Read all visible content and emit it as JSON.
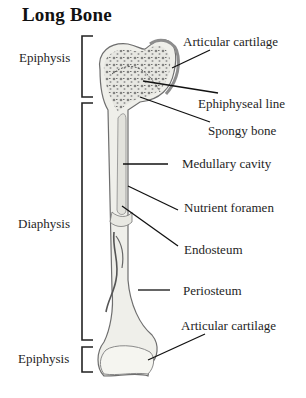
{
  "title": "Long Bone",
  "regions": {
    "epiphysis_top": "Epiphysis",
    "diaphysis": "Diaphysis",
    "epiphysis_bottom": "Epiphysis"
  },
  "labels": {
    "articular_cartilage_top": "Articular cartilage",
    "epiphyseal_line": "Ephiphyseal line",
    "spongy_bone": "Spongy bone",
    "medullary_cavity": "Medullary cavity",
    "nutrient_foramen": "Nutrient foramen",
    "endosteum": "Endosteum",
    "periosteum": "Periosteum",
    "articular_cartilage_bottom": "Articular cartilage"
  },
  "colors": {
    "bone_fill": "#efefea",
    "bone_outline": "#6e6e6e",
    "cartilage": "#9a9a9a",
    "spongy": "#7a7a7a",
    "leader_line": "#111111"
  }
}
